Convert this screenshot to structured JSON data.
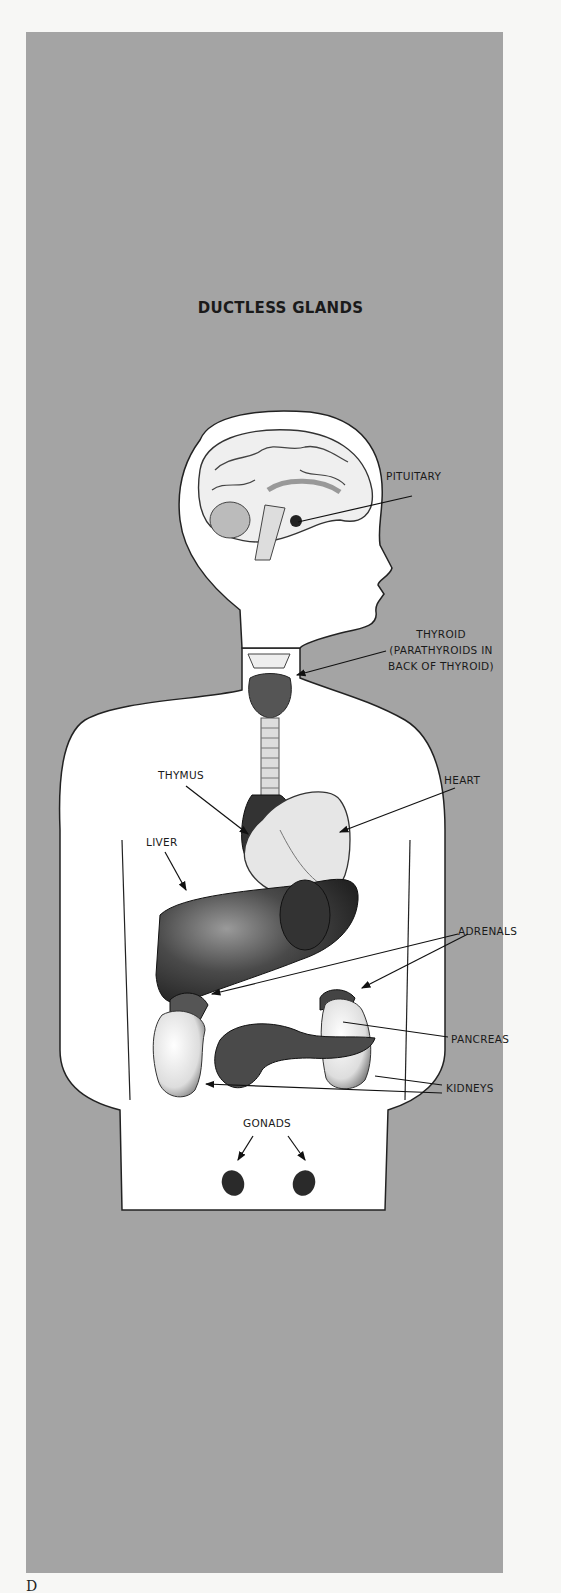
{
  "title": "DUCTLESS GLANDS",
  "labels": {
    "pituitary": "PITUITARY",
    "thyroid": "THYROID",
    "thyroid_note_line1": "(PARATHYROIDS IN",
    "thyroid_note_line2": "BACK OF THYROID)",
    "thymus": "THYMUS",
    "heart": "HEART",
    "liver": "LIVER",
    "adrenals": "ADRENALS",
    "pancreas": "PANCREAS",
    "kidneys": "KIDNEYS",
    "gonads": "GONADS"
  },
  "colors": {
    "background": "#a4a4a4",
    "page": "#f7f7f5",
    "body_fill": "#ffffff",
    "organ_dark": "#3a3a3a",
    "text": "#1a1a1a"
  },
  "footer_text": "D"
}
